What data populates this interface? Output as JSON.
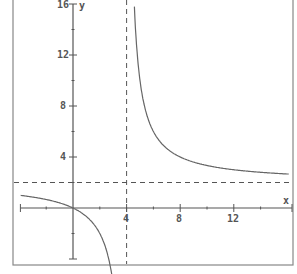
{
  "chart_data": {
    "type": "line",
    "title": "",
    "xlabel": "x",
    "ylabel": "y",
    "xlim": [
      -4,
      16.2
    ],
    "ylim": [
      -4.5,
      16
    ],
    "x_ticks": [
      4,
      8,
      12
    ],
    "y_ticks": [
      4,
      8,
      12,
      16
    ],
    "x_tick_labels": [
      "4",
      "8",
      "12"
    ],
    "y_tick_labels": [
      "4",
      "8",
      "12",
      "16"
    ],
    "minor_ticks_every": 2,
    "grid": false,
    "legend": null,
    "series": [
      {
        "name": "y = 2x/(x-4)",
        "x": [
          -4,
          -2,
          0,
          1,
          2,
          2.75,
          4.5,
          5,
          6,
          8,
          10,
          12,
          16
        ],
        "y": [
          1,
          0.67,
          0,
          -0.67,
          -2,
          -4.4,
          18,
          10,
          6,
          4,
          3.33,
          3,
          2.67
        ]
      }
    ],
    "asymptotes": {
      "vertical": {
        "x": 4,
        "style": "dashed"
      },
      "horizontal": {
        "y": 2,
        "style": "dashed"
      }
    },
    "colors": {
      "curve": "#666666",
      "axes": "#555555",
      "asymptote": "#555555",
      "frame": "#777777"
    }
  }
}
